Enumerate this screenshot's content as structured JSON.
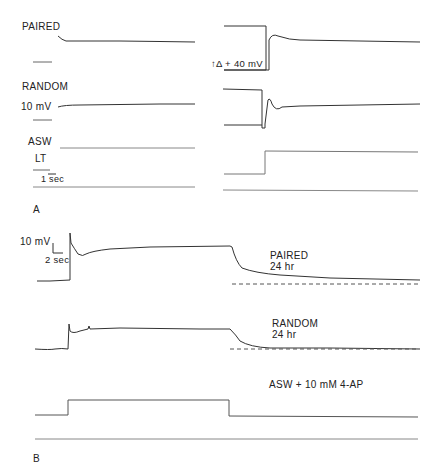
{
  "panel_a": {
    "letter": "A",
    "labels": {
      "paired": "PAIRED",
      "random": "RANDOM",
      "scale_mv": "10 mV",
      "asw": "ASW",
      "lt": "LT",
      "scale_time": "1 sec",
      "delta": "↑Δ + 40 mV"
    }
  },
  "panel_b": {
    "letter": "B",
    "labels": {
      "scale_mv": "10 mV",
      "scale_time": "2 sec",
      "paired": "PAIRED",
      "paired_time": "24 hr",
      "random": "RANDOM",
      "random_time": "24 hr",
      "solution": "ASW + 10 mM 4-AP"
    }
  },
  "colors": {
    "trace": "#333333",
    "light_trace": "#888888",
    "background": "#ffffff"
  }
}
